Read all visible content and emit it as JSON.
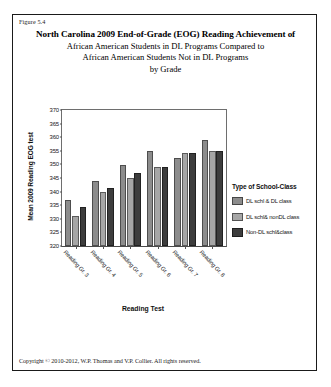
{
  "figure": {
    "number_label": "Figure 5.4",
    "copyright": "Copyright © 2010-2012, W.P. Thomas and V.P. Collier.  All rights reserved."
  },
  "title": {
    "line1": "North Carolina 2009 End-of-Grade (EOG) Reading Achievement of",
    "line2": "African American Students in DL Programs Compared to",
    "line3": "African American Students Not in DL Programs",
    "line4": "by Grade"
  },
  "legend": {
    "title": "Type of School-Class",
    "items": [
      {
        "label": "DL schl & DL class",
        "color": "#8c8c8c"
      },
      {
        "label": "DL schl& nonDL class",
        "color": "#a6a6a6"
      },
      {
        "label": "Non-DL schl&class",
        "color": "#3d3d3d"
      }
    ]
  },
  "chart_data": {
    "type": "bar",
    "title": "North Carolina 2009 End-of-Grade (EOG) Reading Achievement of African American Students in DL Programs Compared to African American Students Not in DL Programs by Grade",
    "xlabel": "Reading Test",
    "ylabel": "Mean 2009 Reading EOG test",
    "categories": [
      "Reading Gr. 3",
      "Reading Gr. 4",
      "Reading Gr. 5",
      "Reading Gr. 6",
      "Reading Gr. 7",
      "Reading Gr. 8"
    ],
    "series": [
      {
        "name": "DL schl & DL class",
        "color": "#8c8c8c",
        "values": [
          337.0,
          343.9,
          349.8,
          355.0,
          352.2,
          358.8
        ]
      },
      {
        "name": "DL schl& nonDL class",
        "color": "#a6a6a6",
        "values": [
          331.0,
          340.0,
          345.0,
          348.9,
          354.2,
          355.0
        ]
      },
      {
        "name": "Non-DL schl&class",
        "color": "#3d3d3d",
        "values": [
          334.5,
          341.4,
          346.9,
          348.9,
          354.2,
          355.0
        ]
      }
    ],
    "ylim": [
      320,
      370
    ],
    "yticks": [
      320,
      325,
      330,
      335,
      340,
      345,
      350,
      355,
      360,
      365,
      370
    ],
    "grid": false,
    "legend_position": "right",
    "legend_title": "Type of School-Class"
  }
}
